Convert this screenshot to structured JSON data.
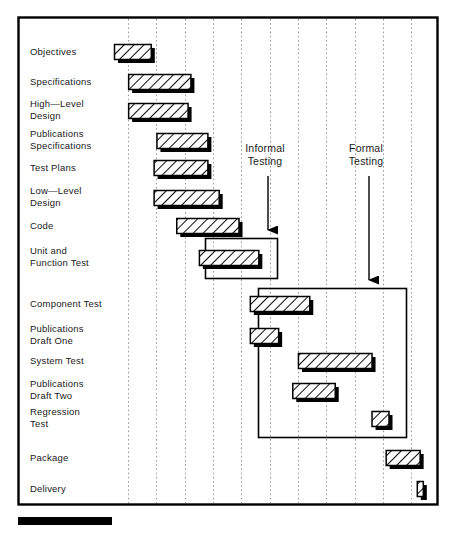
{
  "chart_data": {
    "type": "bar",
    "orientation": "horizontal",
    "subtype": "gantt",
    "xlabel": "",
    "ylabel": "",
    "xlim": [
      0,
      11
    ],
    "grid": true,
    "gridlines_count": 11,
    "legend_position": "none",
    "categories": [
      "Objectives",
      "Specifications",
      "High—Level Design",
      "Publications Specifications",
      "Test Plans",
      "Low—Level Design",
      "Code",
      "Unit and Function Test",
      "Component Test",
      "Publications Draft One",
      "System Test",
      "Publications Draft Two",
      "Regression Test",
      "Package",
      "Delivery"
    ],
    "tasks": [
      {
        "label_line1": "Objectives",
        "label_line2": "",
        "start": 0.0,
        "duration": 1.3,
        "row": 0
      },
      {
        "label_line1": "Specifications",
        "label_line2": "",
        "start": 0.5,
        "duration": 2.2,
        "row": 1
      },
      {
        "label_line1": "High—Level",
        "label_line2": "Design",
        "start": 0.5,
        "duration": 2.1,
        "row": 2
      },
      {
        "label_line1": "Publications",
        "label_line2": "Specifications",
        "start": 1.5,
        "duration": 1.8,
        "row": 3
      },
      {
        "label_line1": "Test Plans",
        "label_line2": "",
        "start": 1.4,
        "duration": 1.9,
        "row": 4
      },
      {
        "label_line1": "Low—Level",
        "label_line2": "Design",
        "start": 1.4,
        "duration": 2.3,
        "row": 5
      },
      {
        "label_line1": "Code",
        "label_line2": "",
        "start": 2.2,
        "duration": 2.2,
        "row": 6
      },
      {
        "label_line1": "Unit and",
        "label_line2": "Function Test",
        "start": 3.0,
        "duration": 2.1,
        "row": 7
      },
      {
        "label_line1": "Component Test",
        "label_line2": "",
        "start": 4.8,
        "duration": 2.1,
        "row": 8
      },
      {
        "label_line1": "Publications",
        "label_line2": "Draft One",
        "start": 4.8,
        "duration": 1.0,
        "row": 9
      },
      {
        "label_line1": "System Test",
        "label_line2": "",
        "start": 6.5,
        "duration": 2.6,
        "row": 10
      },
      {
        "label_line1": "Publications",
        "label_line2": "Draft Two",
        "start": 6.3,
        "duration": 1.5,
        "row": 11
      },
      {
        "label_line1": "Regression",
        "label_line2": "Test",
        "start": 9.1,
        "duration": 0.6,
        "row": 12
      },
      {
        "label_line1": "Package",
        "label_line2": "",
        "start": 9.6,
        "duration": 1.2,
        "row": 13
      },
      {
        "label_line1": "Delivery",
        "label_line2": "",
        "start": 10.7,
        "duration": 0.2,
        "row": 14
      }
    ],
    "annotations": [
      {
        "text_line1": "Informal",
        "text_line2": "Testing",
        "target_row": 7,
        "note": "leader line with arrowhead pointing to Informal Testing group box"
      },
      {
        "text_line1": "Formal",
        "text_line2": "Testing",
        "target_row": 8,
        "note": "leader line with arrowhead pointing to Formal Testing group box"
      }
    ],
    "group_boxes": [
      {
        "name": "Informal Testing",
        "rows": [
          7
        ],
        "label": "Informal Testing"
      },
      {
        "name": "Formal Testing",
        "rows": [
          8,
          9,
          10,
          11,
          12
        ],
        "label": "Formal Testing"
      }
    ],
    "colors": {
      "frame": "#000000",
      "bar_fill": "#ffffff",
      "bar_hatch": "#000000",
      "bar_border": "#000000",
      "bar_shadow": "#000000",
      "gridline": "#9a9a9a",
      "text": "#1a1a1a",
      "progress_bar": "#000000"
    }
  },
  "progress_bar": {
    "name": "progress-indicator",
    "filled": true
  }
}
